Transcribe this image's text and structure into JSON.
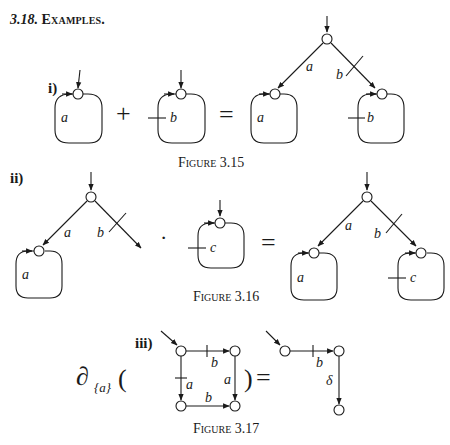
{
  "section": {
    "number": "3.18.",
    "title": "Examples."
  },
  "examples": [
    {
      "label": "i)",
      "caption": "Figure 3.15",
      "lhs": [
        {
          "loop_label": "a",
          "has_skip": false
        },
        {
          "loop_label": "b",
          "has_skip": true
        }
      ],
      "operator": "+",
      "equals": "=",
      "rhs": {
        "left_edge_label": "a",
        "right_edge_label": "b",
        "right_edge_skip": true,
        "left_loop_label": "a",
        "right_loop_label": "b",
        "right_loop_skip": true
      }
    },
    {
      "label": "ii)",
      "caption": "Figure 3.16",
      "lhs": {
        "left_edge_label": "a",
        "right_edge_label": "b",
        "right_edge_skip": true,
        "left_loop_label": "a"
      },
      "operator": "·",
      "factor": {
        "loop_label": "c",
        "has_skip": true
      },
      "equals": "=",
      "rhs": {
        "left_edge_label": "a",
        "right_edge_label": "b",
        "right_edge_skip": true,
        "left_loop_label": "a",
        "right_loop_label": "c",
        "right_loop_skip": true
      }
    },
    {
      "label": "iii)",
      "caption": "Figure 3.17",
      "operator_text": "∂",
      "operator_subscript": "{a}",
      "open_paren": "(",
      "close_paren": ")",
      "equals": "=",
      "lhs_edges": [
        {
          "from": "top-left",
          "to": "top-right",
          "label": "b",
          "skip": true
        },
        {
          "from": "top-left",
          "to": "bottom-left",
          "label": "a",
          "skip": true
        },
        {
          "from": "top-right",
          "to": "bottom-right",
          "label": "a",
          "skip": false
        },
        {
          "from": "bottom-left",
          "to": "bottom-right",
          "label": "b",
          "skip": false
        }
      ],
      "rhs_edges": [
        {
          "from": "left",
          "to": "right",
          "label": "b",
          "skip": true
        },
        {
          "from": "right",
          "to": "bottom",
          "label": "δ",
          "skip": false
        }
      ]
    }
  ]
}
